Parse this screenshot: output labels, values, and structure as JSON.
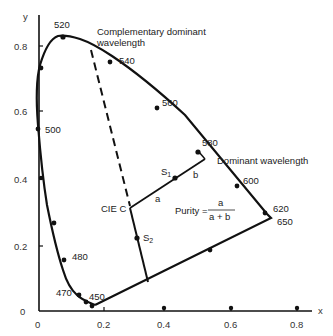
{
  "diagram": {
    "axes": {
      "x_label": "x",
      "y_label": "y",
      "x_ticks": [
        "0",
        "0.2",
        "0.4",
        "0.6",
        "0.8"
      ],
      "y_ticks": [
        "0",
        "0.2",
        "0.4",
        "0.6",
        "0.8"
      ]
    },
    "wavelength_labels": [
      "450",
      "470",
      "480",
      "500",
      "520",
      "540",
      "560",
      "580",
      "600",
      "620",
      "650"
    ],
    "annotations": {
      "complementary_line1": "Complementary dominant",
      "complementary_line2": "wavelength",
      "dominant": "Dominant wavelength",
      "white_point": "CIE C",
      "s1": "S",
      "s1_sub": "1",
      "s2": "S",
      "s2_sub": "2",
      "a": "a",
      "b": "b",
      "purity_label": "Purity =",
      "purity_num": "a",
      "purity_den": "a + b"
    },
    "colors": {
      "ink": "#111111",
      "background": "#ffffff"
    }
  }
}
